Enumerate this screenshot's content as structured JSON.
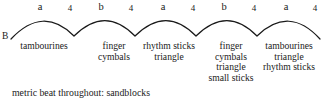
{
  "diagram": {
    "form_label": "B",
    "phrases": [
      {
        "letter": "a",
        "letter_x": 40,
        "beat": "4",
        "beat_x": 70
      },
      {
        "letter": "b",
        "letter_x": 101,
        "beat": "4",
        "beat_x": 131
      },
      {
        "letter": "a",
        "letter_x": 163,
        "beat": "4",
        "beat_x": 193
      },
      {
        "letter": "b",
        "letter_x": 224,
        "beat": "4",
        "beat_x": 254
      },
      {
        "letter": "a",
        "letter_x": 286,
        "beat": "4",
        "beat_x": 315
      }
    ],
    "arc_path": "M 11 39 Q 43 5 74 36 Q 105 5 135 36 Q 166 5 196 36 Q 227 5 257 36 Q 289 5 320 39",
    "stroke_color": "#1a1a1a",
    "instrument_columns": [
      {
        "x": 12,
        "width": 64,
        "lines": [
          "tambourines"
        ]
      },
      {
        "x": 92,
        "width": 44,
        "lines": [
          "finger",
          "cymbals"
        ]
      },
      {
        "x": 137,
        "width": 64,
        "lines": [
          "rhythm sticks",
          "triangle"
        ]
      },
      {
        "x": 203,
        "width": 56,
        "lines": [
          "finger",
          "cymbals",
          "triangle",
          "small sticks"
        ]
      },
      {
        "x": 257,
        "width": 64,
        "lines": [
          "tambourines",
          "triangle",
          "rhythm sticks"
        ]
      }
    ],
    "caption": "metric beat throughout: sandblocks"
  }
}
